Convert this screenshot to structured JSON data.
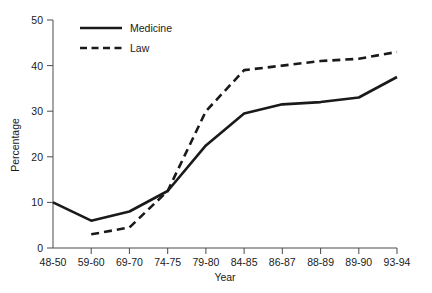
{
  "chart_data": {
    "type": "line",
    "title": "",
    "xlabel": "Year",
    "ylabel": "Percentage",
    "categories": [
      "48-50",
      "59-60",
      "69-70",
      "74-75",
      "79-80",
      "84-85",
      "86-87",
      "88-89",
      "89-90",
      "93-94"
    ],
    "ylim": [
      0,
      50
    ],
    "yticks": [
      0,
      10,
      20,
      30,
      40,
      50
    ],
    "ytick_labels": [
      "0",
      "10",
      "20",
      "30",
      "40",
      "50"
    ],
    "grid": false,
    "legend_position": "top-left-inside",
    "series": [
      {
        "name": "Medicine",
        "style": "solid",
        "color": "#1a1a1a",
        "values": [
          10,
          6,
          8,
          12.5,
          22.5,
          29.5,
          31.5,
          32,
          33,
          37.5
        ]
      },
      {
        "name": "Law",
        "style": "dashed",
        "color": "#1a1a1a",
        "values": [
          null,
          3,
          4.5,
          12.5,
          30,
          39,
          40,
          41,
          41.5,
          43
        ]
      }
    ]
  },
  "legend": {
    "items": [
      {
        "label": "Medicine",
        "style": "solid"
      },
      {
        "label": "Law",
        "style": "dashed"
      }
    ]
  },
  "caption": {
    "text": ""
  }
}
